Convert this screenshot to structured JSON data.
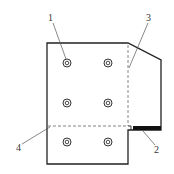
{
  "diagram": {
    "type": "technical-drawing",
    "labels": [
      {
        "id": "1",
        "text": "1",
        "x": 51,
        "y": 20,
        "target": "bolt-hole"
      },
      {
        "id": "2",
        "text": "2",
        "x": 155,
        "y": 152,
        "target": "black-strip"
      },
      {
        "id": "3",
        "text": "3",
        "x": 147,
        "y": 20,
        "target": "vertical-fold-line"
      },
      {
        "id": "4",
        "text": "4",
        "x": 17,
        "y": 150,
        "target": "horizontal-fold-line"
      }
    ],
    "holes_count": 6,
    "colors": {
      "stroke": "#222222",
      "strip": "#111111",
      "leader": "#555555",
      "background": "#ffffff"
    }
  }
}
